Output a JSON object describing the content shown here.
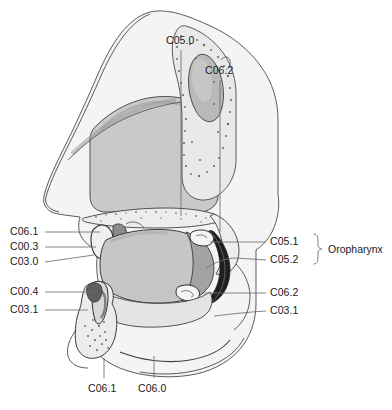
{
  "figure": {
    "colors": {
      "outline": "#3a3a3a",
      "tongue_body": "#c6c6c6",
      "tongue_posterior": "#a5a5a5",
      "pharynx_dark": "#1f1f1f",
      "soft_tissue": "#ebebeb",
      "bone": "#e2e2e2",
      "cartilage": "#d4d4d4",
      "nasal_mucosa": "#cfcfcf",
      "leader_line": "#6e6e6e",
      "text": "#1a1a1a"
    }
  },
  "labels": {
    "top": [
      {
        "id": "c05-0",
        "text": "C05.0",
        "x": 166,
        "y": 40
      },
      {
        "id": "c06-2-top",
        "text": "C06.2",
        "x": 205,
        "y": 70
      }
    ],
    "left_upper": [
      {
        "id": "c06-1-left",
        "text": "C06.1",
        "x": 10,
        "y": 229
      },
      {
        "id": "c00-3",
        "text": "C00.3",
        "x": 10,
        "y": 244
      },
      {
        "id": "c03-0",
        "text": "C03.0",
        "x": 10,
        "y": 259
      }
    ],
    "left_lower": [
      {
        "id": "c00-4",
        "text": "C00.4",
        "x": 10,
        "y": 289
      },
      {
        "id": "c03-1-left",
        "text": "C03.1",
        "x": 10,
        "y": 307
      }
    ],
    "right_upper": [
      {
        "id": "c05-1",
        "text": "C05.1",
        "x": 272,
        "y": 239
      },
      {
        "id": "c05-2",
        "text": "C05.2",
        "x": 272,
        "y": 257
      }
    ],
    "right_lower": [
      {
        "id": "c06-2-right",
        "text": "C06.2",
        "x": 272,
        "y": 290
      },
      {
        "id": "c03-1-right",
        "text": "C03.1",
        "x": 272,
        "y": 308
      }
    ],
    "bottom": [
      {
        "id": "c06-1-bottom",
        "text": "C06.1",
        "x": 91,
        "y": 388
      },
      {
        "id": "c06-0",
        "text": "C06.0",
        "x": 141,
        "y": 388
      }
    ],
    "bracket_group": {
      "id": "oropharynx",
      "text": "Oropharynx",
      "x": 330,
      "y": 248
    }
  }
}
